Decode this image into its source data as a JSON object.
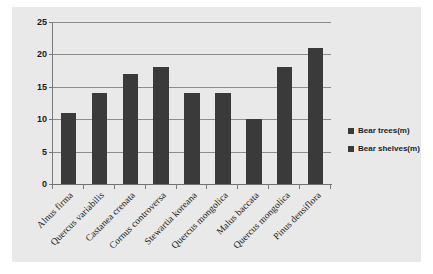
{
  "chart_data": {
    "type": "bar",
    "title": "",
    "subtitle": "",
    "xlabel": "",
    "ylabel": "",
    "ylim": [
      0,
      25
    ],
    "yticks": [
      0,
      5,
      10,
      15,
      20,
      25
    ],
    "grid": true,
    "legend_position": "right",
    "categories": [
      "Alnus firma",
      "Quercus variabilis",
      "Castanea crenata",
      "Cornus controversa",
      "Stewartia koreana",
      "Quercus mongolica",
      "Malus baccata",
      "Quercus mongolica",
      "Pinus densiflora"
    ],
    "series": [
      {
        "name": "Bear trees(m)",
        "color": "#3a3a3a",
        "values": [
          11,
          14,
          17,
          18,
          14,
          14,
          10,
          18,
          21
        ]
      }
    ],
    "legend": [
      {
        "label": "Bear trees(m)",
        "color": "#3a3a3a"
      },
      {
        "label": "Bear shelves(m)",
        "color": "#3a3a3a"
      }
    ]
  },
  "style": {
    "canvas_background": "#e9e9e9",
    "page_background": "#ffffff",
    "bar_color": "#3a3a3a",
    "grid_color": "#8d8d8d",
    "axis_color": "#6f6f6f",
    "text_color": "#1c1c1c"
  }
}
